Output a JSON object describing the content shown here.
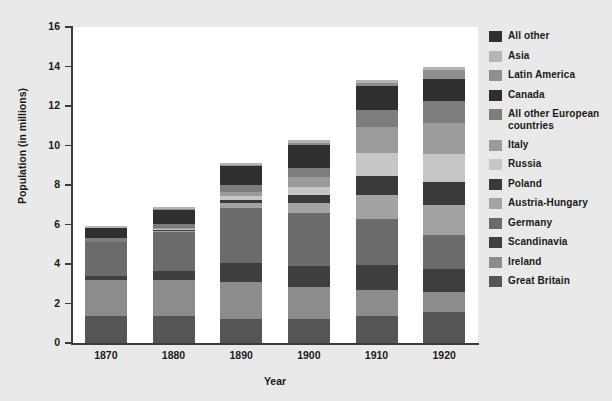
{
  "chart_data": {
    "type": "bar",
    "subtype": "stacked-vertical",
    "title": "",
    "xlabel": "Year",
    "ylabel": "Population (in millions)",
    "categories": [
      "1870",
      "1880",
      "1890",
      "1900",
      "1910",
      "1920"
    ],
    "ylim": [
      0,
      16
    ],
    "yticks": [
      0,
      2,
      4,
      6,
      8,
      10,
      12,
      14,
      16
    ],
    "ytick_labels": [
      "0",
      "2",
      "4",
      "6",
      "8",
      "10",
      "12",
      "14",
      "16"
    ],
    "grid": false,
    "legend_position": "right",
    "stack_order_bottom_to_top": [
      "Great Britain",
      "Ireland",
      "Scandinavia",
      "Germany",
      "Austria-Hungary",
      "Poland",
      "Russia",
      "Italy",
      "All other European countries",
      "Canada",
      "Latin America",
      "Asia",
      "All other"
    ],
    "series": [
      {
        "name": "Great Britain",
        "color": "#555555",
        "values": [
          1.35,
          1.35,
          1.2,
          1.2,
          1.35,
          1.55
        ]
      },
      {
        "name": "Ireland",
        "color": "#8c8c8c",
        "values": [
          1.85,
          1.85,
          1.9,
          1.65,
          1.35,
          1.05
        ]
      },
      {
        "name": "Scandinavia",
        "color": "#3f3f3f",
        "values": [
          0.2,
          0.45,
          0.95,
          1.05,
          1.25,
          1.15
        ]
      },
      {
        "name": "Germany",
        "color": "#6b6b6b",
        "values": [
          1.7,
          1.95,
          2.8,
          2.7,
          2.35,
          1.7
        ]
      },
      {
        "name": "Austria-Hungary",
        "color": "#a3a3a3",
        "values": [
          0.0,
          0.05,
          0.25,
          0.5,
          1.2,
          1.55
        ]
      },
      {
        "name": "Poland",
        "color": "#3a3a3a",
        "values": [
          0.0,
          0.05,
          0.15,
          0.4,
          0.95,
          1.15
        ]
      },
      {
        "name": "Russia",
        "color": "#c6c6c6",
        "values": [
          0.0,
          0.05,
          0.2,
          0.4,
          1.15,
          1.4
        ]
      },
      {
        "name": "Italy",
        "color": "#9b9b9b",
        "values": [
          0.0,
          0.05,
          0.2,
          0.5,
          1.35,
          1.6
        ]
      },
      {
        "name": "All other European countries",
        "color": "#7d7d7d",
        "values": [
          0.2,
          0.25,
          0.35,
          0.45,
          0.85,
          1.1
        ]
      },
      {
        "name": "Canada",
        "color": "#2f2f2f",
        "values": [
          0.5,
          0.7,
          0.95,
          1.2,
          1.2,
          1.1
        ]
      },
      {
        "name": "Latin America",
        "color": "#8f8f8f",
        "values": [
          0.0,
          0.05,
          0.05,
          0.1,
          0.15,
          0.45
        ]
      },
      {
        "name": "Asia",
        "color": "#b5b5b5",
        "values": [
          0.1,
          0.1,
          0.1,
          0.15,
          0.15,
          0.2
        ]
      },
      {
        "name": "All other",
        "color": "#303030",
        "values": [
          0.0,
          0.0,
          0.0,
          0.0,
          0.0,
          0.0
        ]
      }
    ],
    "totals": [
      5.9,
      6.9,
      9.1,
      10.3,
      13.3,
      14.5
    ]
  },
  "legend": {
    "items": [
      {
        "label": "All other",
        "color": "#303030"
      },
      {
        "label": "Asia",
        "color": "#b5b5b5"
      },
      {
        "label": "Latin America",
        "color": "#8f8f8f"
      },
      {
        "label": "Canada",
        "color": "#2f2f2f"
      },
      {
        "label": "All other European countries",
        "color": "#7d7d7d"
      },
      {
        "label": "Italy",
        "color": "#9b9b9b"
      },
      {
        "label": "Russia",
        "color": "#c6c6c6"
      },
      {
        "label": "Poland",
        "color": "#3a3a3a"
      },
      {
        "label": "Austria-Hungary",
        "color": "#a3a3a3"
      },
      {
        "label": "Germany",
        "color": "#6b6b6b"
      },
      {
        "label": "Scandinavia",
        "color": "#3f3f3f"
      },
      {
        "label": "Ireland",
        "color": "#8c8c8c"
      },
      {
        "label": "Great Britain",
        "color": "#555555"
      }
    ]
  },
  "theme": {
    "figure_background": "#e9e9e9",
    "plot_background": "#ffffff",
    "axis_color": "#3b3b3b",
    "text_color": "#1a1a1a"
  }
}
